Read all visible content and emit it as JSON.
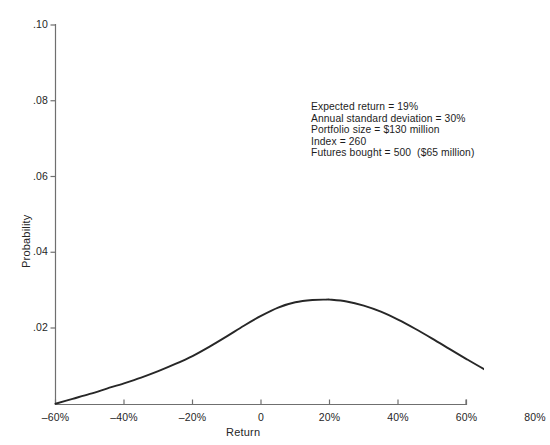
{
  "chart_data": {
    "type": "line",
    "title": "",
    "xlabel": "Return",
    "ylabel": "Probability",
    "xlim": [
      -60,
      90
    ],
    "ylim": [
      0,
      0.1
    ],
    "grid": false,
    "legend": null,
    "x_ticks": [
      {
        "value": -60,
        "label": "–60%"
      },
      {
        "value": -40,
        "label": "–40%"
      },
      {
        "value": -20,
        "label": "–20%"
      },
      {
        "value": 0,
        "label": "0"
      },
      {
        "value": 20,
        "label": "20%"
      },
      {
        "value": 40,
        "label": "40%"
      },
      {
        "value": 60,
        "label": "60%"
      },
      {
        "value": 80,
        "label": "80%"
      }
    ],
    "y_ticks": [
      {
        "value": 0.02,
        "label": ".02"
      },
      {
        "value": 0.04,
        "label": ".04"
      },
      {
        "value": 0.06,
        "label": ".06"
      },
      {
        "value": 0.08,
        "label": ".08"
      },
      {
        "value": 0.1,
        "label": ".10"
      }
    ],
    "series": [
      {
        "name": "Return probability distribution",
        "peak_x": 19,
        "peak_y": 0.0275,
        "x": [
          -60,
          -55,
          -50,
          -45,
          -40,
          -35,
          -30,
          -25,
          -20,
          -15,
          -10,
          -5,
          0,
          5,
          10,
          15,
          19,
          20,
          25,
          30,
          35,
          40,
          45,
          50,
          55,
          60,
          65,
          70,
          75,
          80,
          85,
          88
        ],
        "values": [
          0.0,
          0.0013,
          0.0026,
          0.004,
          0.0054,
          0.0069,
          0.0086,
          0.0105,
          0.0126,
          0.0151,
          0.0178,
          0.0206,
          0.0232,
          0.0254,
          0.0268,
          0.0274,
          0.0275,
          0.0275,
          0.027,
          0.0259,
          0.0243,
          0.0222,
          0.0198,
          0.0172,
          0.0145,
          0.0118,
          0.0092,
          0.0068,
          0.0046,
          0.0027,
          0.0009,
          0.0
        ]
      }
    ],
    "annotations": [
      "Expected return = 19%",
      "Annual standard deviation = 30%",
      "Portfolio size = $130 million",
      "Index = 260",
      "Futures bought = 500  ($65 million)"
    ]
  },
  "axis_label_x": "Return",
  "axis_label_y": "Probability",
  "caption_partial": "",
  "colors": {
    "curve": "#272727",
    "axis": "#6f6f6f",
    "text": "#262626",
    "background": "#ffffff"
  }
}
